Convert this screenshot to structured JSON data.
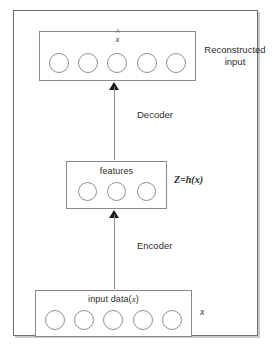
{
  "diagram": {
    "type": "block-diagram",
    "background_color": "#ffffff",
    "frame_color": "#6f6f6f",
    "box_border_color": "#8a8a8a",
    "neuron_border_color": "#8f8f8f",
    "arrow_color": "#1c1c1c",
    "text_color": "#2c2c2c"
  },
  "layers": {
    "reconstructed": {
      "caption": "",
      "hat_symbol": "x",
      "hat_mark": "^",
      "neuron_count": 5,
      "side_label_line1": "Reconstructed",
      "side_label_line2": "input"
    },
    "features": {
      "caption": "features",
      "neuron_count": 3,
      "side_label": "Z=h(x)"
    },
    "input": {
      "caption_prefix": "input data(",
      "caption_var": "x",
      "caption_suffix": ")",
      "neuron_count": 5,
      "side_label": "x"
    }
  },
  "arrows": {
    "decoder": {
      "label": "Decoder",
      "direction": "up"
    },
    "encoder": {
      "label": "Encoder",
      "direction": "up"
    }
  }
}
